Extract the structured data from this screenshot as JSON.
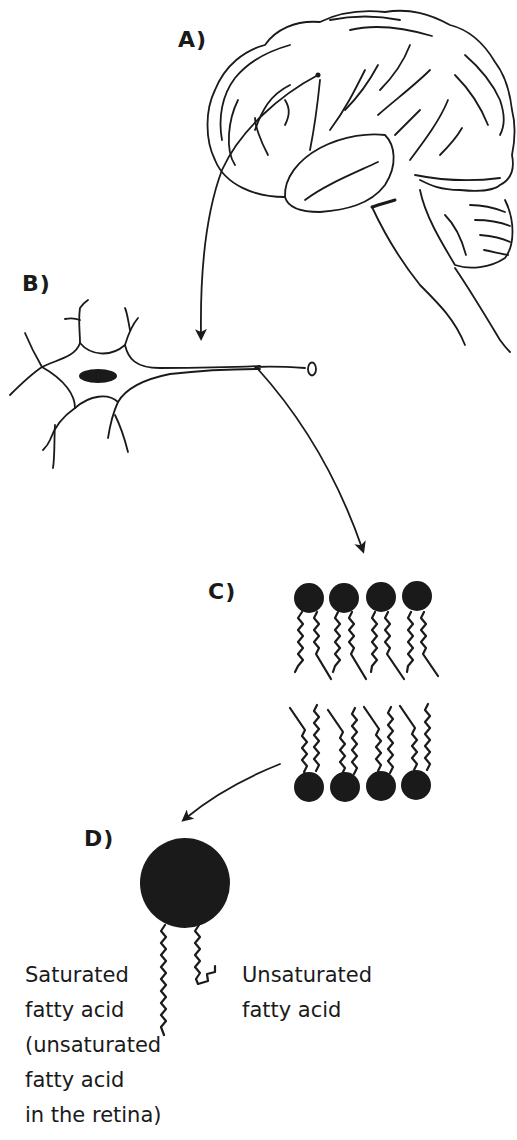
{
  "figure": {
    "stroke_color": "#1a1a1a",
    "background_color": "#ffffff"
  },
  "panels": {
    "a": {
      "label": "A)",
      "subject": "brain"
    },
    "b": {
      "label": "B)",
      "subject": "neuron"
    },
    "c": {
      "label": "C)",
      "subject": "phospholipid bilayer",
      "heads_per_row": 4
    },
    "d": {
      "label": "D)",
      "subject": "phospholipid molecule"
    }
  },
  "captions": {
    "left": {
      "lines": [
        "Saturated",
        "fatty acid",
        "(unsaturated",
        "fatty acid",
        "in the retina)"
      ]
    },
    "right": {
      "lines": [
        "Unsaturated",
        "fatty acid"
      ]
    }
  },
  "arrows": [
    {
      "from": "brain",
      "to": "neuron"
    },
    {
      "from": "neuron-axon",
      "to": "bilayer"
    },
    {
      "from": "bilayer",
      "to": "phospholipid"
    }
  ]
}
